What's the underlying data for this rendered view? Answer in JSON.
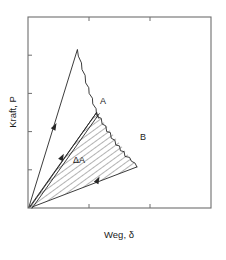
{
  "figure": {
    "axes": {
      "x_label": "Weg, δ",
      "y_label": "Kraft, P",
      "x_ticks_count": 2,
      "y_ticks_count": 4,
      "frame": {
        "left": 28,
        "top": 17,
        "right": 211,
        "bottom": 208
      }
    },
    "labels": {
      "point_a": "A",
      "point_b": "B",
      "delta_area": "ΔA"
    },
    "colors": {
      "frame": "#6e6e6e",
      "curve": "#262626",
      "hatch": "#4a4a4a",
      "text": "#1a1a1a",
      "background": "#ffffff"
    }
  },
  "chart_data": {
    "type": "line",
    "title": "",
    "xlabel": "Weg, δ",
    "ylabel": "Kraft, P",
    "xlim": [
      0,
      1
    ],
    "ylim": [
      0,
      1
    ],
    "grid": false,
    "legend": null,
    "annotations": [
      {
        "text": "A",
        "x": 0.395,
        "y": 0.545,
        "note": "peak of second loading curve"
      },
      {
        "text": "B",
        "x": 0.6,
        "y": 0.375,
        "note": "peak of third loading curve"
      },
      {
        "text": "ΔA",
        "x": 0.29,
        "y": 0.3,
        "note": "hatched energy-difference area"
      }
    ],
    "series": [
      {
        "name": "loading-unloading-curve-1",
        "comment": "steep initial loading ramp to peak, then jagged softening descent back toward origin",
        "points": [
          [
            0.005,
            0.005
          ],
          [
            0.27,
            0.83
          ],
          [
            0.275,
            0.795
          ],
          [
            0.292,
            0.76
          ],
          [
            0.295,
            0.725
          ],
          [
            0.312,
            0.695
          ],
          [
            0.315,
            0.655
          ],
          [
            0.332,
            0.63
          ],
          [
            0.334,
            0.6
          ],
          [
            0.352,
            0.575
          ],
          [
            0.354,
            0.545
          ],
          [
            0.372,
            0.52
          ],
          [
            0.374,
            0.49
          ],
          [
            0.386,
            0.47
          ]
        ]
      },
      {
        "name": "loading-unloading-curve-2",
        "comment": "second ramp from origin to point A, jagged descent to point B region",
        "points": [
          [
            0.012,
            0.005
          ],
          [
            0.375,
            0.5
          ],
          [
            0.385,
            0.475
          ],
          [
            0.4,
            0.47
          ],
          [
            0.405,
            0.44
          ],
          [
            0.425,
            0.43
          ],
          [
            0.43,
            0.4
          ],
          [
            0.45,
            0.395
          ],
          [
            0.455,
            0.365
          ],
          [
            0.475,
            0.355
          ],
          [
            0.48,
            0.33
          ],
          [
            0.5,
            0.325
          ],
          [
            0.505,
            0.3
          ],
          [
            0.525,
            0.295
          ],
          [
            0.53,
            0.27
          ],
          [
            0.555,
            0.265
          ],
          [
            0.565,
            0.245
          ],
          [
            0.585,
            0.235
          ],
          [
            0.595,
            0.215
          ]
        ]
      },
      {
        "name": "unloading-line-lower",
        "comment": "lower straight boundary of the hatched area, from origin out to point B",
        "points": [
          [
            0.022,
            0.005
          ],
          [
            0.595,
            0.215
          ]
        ]
      },
      {
        "name": "unloading-line-upper",
        "comment": "upper straight boundary (drawn as a close double line) of the hatched area, from origin to point A",
        "points": [
          [
            0.008,
            0.005
          ],
          [
            0.375,
            0.5
          ]
        ]
      }
    ],
    "shaded_regions": [
      {
        "name": "delta-A-region",
        "label": "ΔA",
        "pattern": "diagonal-hatch",
        "vertices": [
          [
            0.015,
            0.005
          ],
          [
            0.375,
            0.5
          ],
          [
            0.595,
            0.215
          ]
        ]
      }
    ],
    "direction_arrows": [
      {
        "on": "loading-unloading-curve-1",
        "x": 0.145,
        "y": 0.425,
        "direction": "up-right"
      },
      {
        "on": "unloading-line-upper",
        "x": 0.185,
        "y": 0.265,
        "direction": "up-right"
      },
      {
        "on": "unloading-line-lower",
        "x": 0.38,
        "y": 0.145,
        "direction": "up-right"
      }
    ]
  }
}
